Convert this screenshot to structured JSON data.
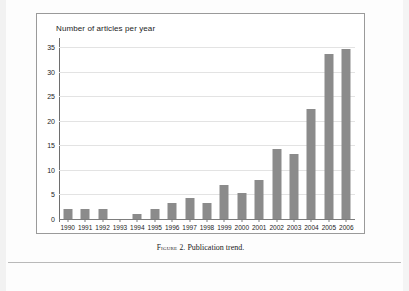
{
  "figure": {
    "caption_label": "Figure 2.",
    "caption_text": "Publication trend."
  },
  "chart_data": {
    "type": "bar",
    "title": "Number of articles per year",
    "xlabel": "",
    "ylabel": "",
    "ylim": [
      0,
      35
    ],
    "yticks": [
      0,
      5,
      10,
      15,
      20,
      25,
      30,
      35
    ],
    "ytick_labels": [
      "0",
      "5",
      "10",
      "15",
      "20",
      "25",
      "30",
      "35"
    ],
    "grid": true,
    "legend": false,
    "bar_color": "#8b8b8b",
    "categories": [
      "1990",
      "1991",
      "1992",
      "1993",
      "1994",
      "1995",
      "1996",
      "1997",
      "1998",
      "1999",
      "2000",
      "2001",
      "2002",
      "2003",
      "2004",
      "2005",
      "2006"
    ],
    "values": [
      2,
      2,
      2,
      0,
      1,
      2,
      3.3,
      4.2,
      3.3,
      7,
      5.2,
      8,
      14.2,
      13.2,
      22.3,
      33.5,
      34.6
    ]
  }
}
